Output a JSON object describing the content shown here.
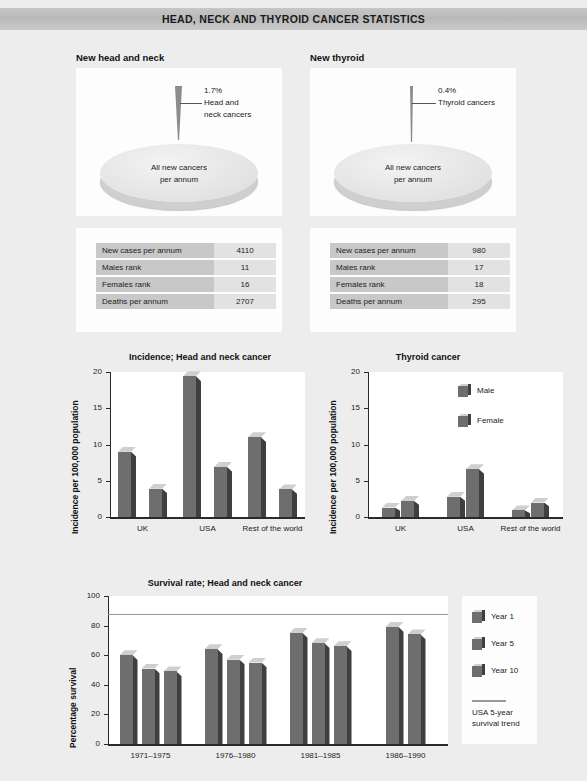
{
  "header": {
    "title": "HEAD, NECK AND THYROID CANCER STATISTICS"
  },
  "colors": {
    "banner": "#bfbfbf",
    "panel_bg": "#ededed",
    "table_key_bg": "#c8c8c8",
    "table_val_bg": "#e2e2e2",
    "bar_front": "#6e6e6e",
    "bar_side": "#3f3f3f",
    "bar_cap": "#cfcfcf",
    "trend_line": "#9a9a9a",
    "pie_slice": "#8c8c8c"
  },
  "pies": [
    {
      "title": "New head and neck",
      "percent": "1.7%",
      "callout_line1": "Head and",
      "callout_line2": "neck cancers",
      "base_label_line1": "All new cancers",
      "base_label_line2": "per annum",
      "table": {
        "rows": [
          {
            "key": "New cases per annum",
            "value": "4110"
          },
          {
            "key": "Males rank",
            "value": "11"
          },
          {
            "key": "Females rank",
            "value": "16"
          },
          {
            "key": "Deaths per annum",
            "value": "2707"
          }
        ]
      }
    },
    {
      "title": "New thyroid",
      "percent": "0.4%",
      "callout_line1": "Thyroid cancers",
      "callout_line2": "",
      "base_label_line1": "All new cancers",
      "base_label_line2": "per annum",
      "table": {
        "rows": [
          {
            "key": "New cases per annum",
            "value": "980"
          },
          {
            "key": "Males rank",
            "value": "17"
          },
          {
            "key": "Females rank",
            "value": "18"
          },
          {
            "key": "Deaths per annum",
            "value": "295"
          }
        ]
      }
    }
  ],
  "chart_data": [
    {
      "type": "bar",
      "id": "incidence-head-neck",
      "title": "Incidence; Head and neck cancer",
      "xlabel": "",
      "ylabel": "Incidence per 100,000 population",
      "categories": [
        "UK",
        "USA",
        "Rest of the world"
      ],
      "series": [
        {
          "name": "Male",
          "values": [
            9.0,
            19.4,
            11.0
          ]
        },
        {
          "name": "Female",
          "values": [
            3.9,
            6.9,
            3.8
          ]
        }
      ],
      "ylim": [
        0,
        20
      ],
      "yticks": [
        "0",
        "5",
        "10",
        "15",
        "20"
      ],
      "grid": false,
      "legend": "none"
    },
    {
      "type": "bar",
      "id": "incidence-thyroid",
      "title": "Thyroid cancer",
      "xlabel": "",
      "ylabel": "Incidence per 100,000 population",
      "categories": [
        "UK",
        "USA",
        "Rest of the world"
      ],
      "series": [
        {
          "name": "Male",
          "values": [
            1.3,
            2.8,
            0.9
          ]
        },
        {
          "name": "Female",
          "values": [
            2.2,
            6.6,
            2.0
          ]
        }
      ],
      "ylim": [
        0,
        20
      ],
      "yticks": [
        "0",
        "5",
        "10",
        "15",
        "20"
      ],
      "grid": false,
      "legend": "inside-top-right",
      "legend_entries": [
        "Male",
        "Female"
      ]
    },
    {
      "type": "bar",
      "id": "survival-head-neck",
      "title": "Survival rate; Head and neck cancer",
      "xlabel": "",
      "ylabel": "Percentage survival",
      "categories": [
        "1971–1975",
        "1976–1980",
        "1981–1985",
        "1986–1990"
      ],
      "series": [
        {
          "name": "Year 1",
          "values": [
            60,
            64,
            75,
            79
          ]
        },
        {
          "name": "Year 5",
          "values": [
            51,
            57,
            68,
            74
          ]
        },
        {
          "name": "Year 10",
          "values": [
            49,
            55,
            66,
            null
          ]
        }
      ],
      "ylim": [
        0,
        100
      ],
      "yticks": [
        "0",
        "20",
        "40",
        "60",
        "80",
        "100"
      ],
      "grid": false,
      "legend": "right",
      "legend_entries": [
        "Year 1",
        "Year 5",
        "Year 10"
      ],
      "trend_line": {
        "label_line1": "USA 5-year",
        "label_line2": "survival trend",
        "value": 88
      }
    }
  ]
}
